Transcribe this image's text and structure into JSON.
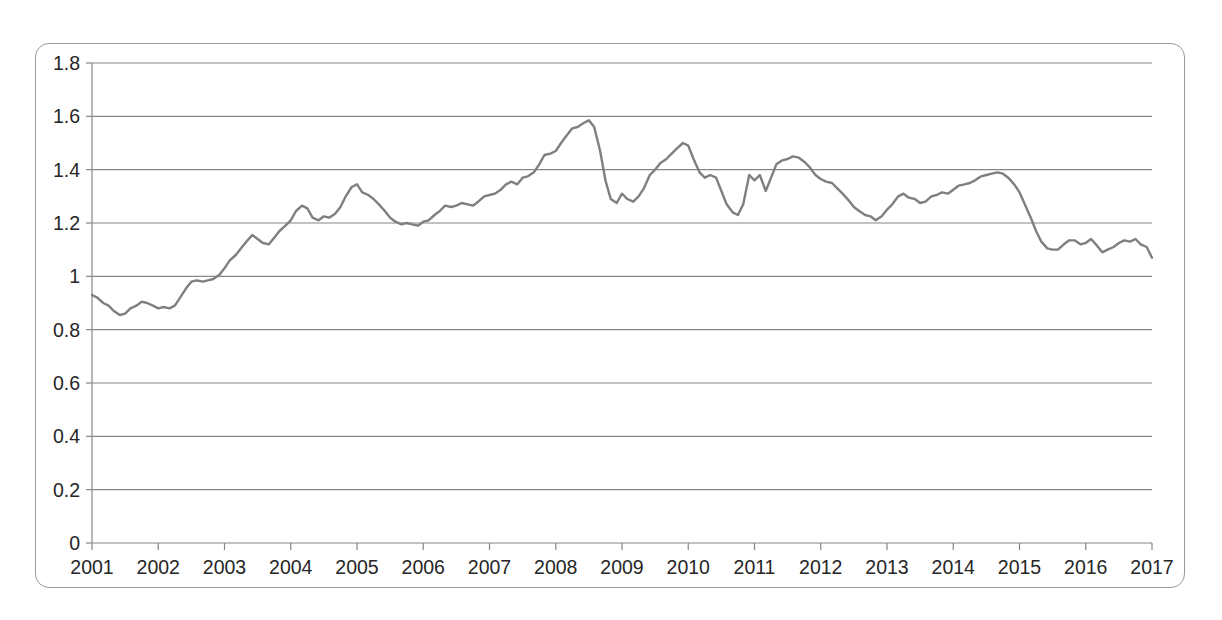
{
  "chart_data": {
    "type": "line",
    "title": "",
    "subtitle": "",
    "xlabel": "",
    "ylabel": "",
    "xlim": [
      2001,
      2017
    ],
    "ylim": [
      0,
      1.8
    ],
    "grid": true,
    "grid_axis": "y",
    "legend": false,
    "legend_position": "none",
    "line_color": "#7f7f7f",
    "background_color": "#ffffff",
    "axis_color": "#868686",
    "y_ticks": [
      "0",
      "0.2",
      "0.4",
      "0.6",
      "0.8",
      "1",
      "1.2",
      "1.4",
      "1.6",
      "1.8"
    ],
    "y_tick_values": [
      0,
      0.2,
      0.4,
      0.6,
      0.8,
      1.0,
      1.2,
      1.4,
      1.6,
      1.8
    ],
    "x_ticks": [
      "2001",
      "2002",
      "2003",
      "2004",
      "2005",
      "2006",
      "2007",
      "2008",
      "2009",
      "2010",
      "2011",
      "2012",
      "2013",
      "2014",
      "2015",
      "2016",
      "2017"
    ],
    "x_tick_values": [
      2001,
      2002,
      2003,
      2004,
      2005,
      2006,
      2007,
      2008,
      2009,
      2010,
      2011,
      2012,
      2013,
      2014,
      2015,
      2016,
      2017
    ],
    "series": [
      {
        "name": "rate",
        "x": [
          2001.0,
          2001.08,
          2001.17,
          2001.25,
          2001.33,
          2001.42,
          2001.5,
          2001.58,
          2001.67,
          2001.75,
          2001.83,
          2001.92,
          2002.0,
          2002.08,
          2002.17,
          2002.25,
          2002.33,
          2002.42,
          2002.5,
          2002.58,
          2002.67,
          2002.75,
          2002.83,
          2002.92,
          2003.0,
          2003.08,
          2003.17,
          2003.25,
          2003.33,
          2003.42,
          2003.5,
          2003.58,
          2003.67,
          2003.75,
          2003.83,
          2003.92,
          2004.0,
          2004.08,
          2004.17,
          2004.25,
          2004.33,
          2004.42,
          2004.5,
          2004.58,
          2004.67,
          2004.75,
          2004.83,
          2004.92,
          2005.0,
          2005.08,
          2005.17,
          2005.25,
          2005.33,
          2005.42,
          2005.5,
          2005.58,
          2005.67,
          2005.75,
          2005.83,
          2005.92,
          2006.0,
          2006.08,
          2006.17,
          2006.25,
          2006.33,
          2006.42,
          2006.5,
          2006.58,
          2006.67,
          2006.75,
          2006.83,
          2006.92,
          2007.0,
          2007.08,
          2007.17,
          2007.25,
          2007.33,
          2007.42,
          2007.5,
          2007.58,
          2007.67,
          2007.75,
          2007.83,
          2007.92,
          2008.0,
          2008.08,
          2008.17,
          2008.25,
          2008.33,
          2008.42,
          2008.5,
          2008.58,
          2008.67,
          2008.75,
          2008.83,
          2008.92,
          2009.0,
          2009.08,
          2009.17,
          2009.25,
          2009.33,
          2009.42,
          2009.5,
          2009.58,
          2009.67,
          2009.75,
          2009.83,
          2009.92,
          2010.0,
          2010.08,
          2010.17,
          2010.25,
          2010.33,
          2010.42,
          2010.5,
          2010.58,
          2010.67,
          2010.75,
          2010.83,
          2010.92,
          2011.0,
          2011.08,
          2011.17,
          2011.25,
          2011.33,
          2011.42,
          2011.5,
          2011.58,
          2011.67,
          2011.75,
          2011.83,
          2011.92,
          2012.0,
          2012.08,
          2012.17,
          2012.25,
          2012.33,
          2012.42,
          2012.5,
          2012.58,
          2012.67,
          2012.75,
          2012.83,
          2012.92,
          2013.0,
          2013.08,
          2013.17,
          2013.25,
          2013.33,
          2013.42,
          2013.5,
          2013.58,
          2013.67,
          2013.75,
          2013.83,
          2013.92,
          2014.0,
          2014.08,
          2014.17,
          2014.25,
          2014.33,
          2014.42,
          2014.5,
          2014.58,
          2014.67,
          2014.75,
          2014.83,
          2014.92,
          2015.0,
          2015.08,
          2015.17,
          2015.25,
          2015.33,
          2015.42,
          2015.5,
          2015.58,
          2015.67,
          2015.75,
          2015.83,
          2015.92,
          2016.0,
          2016.08,
          2016.17,
          2016.25,
          2016.33,
          2016.42,
          2016.5,
          2016.58,
          2016.67,
          2016.75,
          2016.83,
          2016.92,
          2017.0
        ],
        "values": [
          0.93,
          0.92,
          0.9,
          0.89,
          0.87,
          0.855,
          0.86,
          0.88,
          0.89,
          0.905,
          0.9,
          0.89,
          0.88,
          0.885,
          0.88,
          0.89,
          0.92,
          0.955,
          0.98,
          0.985,
          0.98,
          0.985,
          0.99,
          1.005,
          1.03,
          1.06,
          1.08,
          1.105,
          1.13,
          1.155,
          1.14,
          1.125,
          1.12,
          1.145,
          1.17,
          1.19,
          1.21,
          1.245,
          1.265,
          1.255,
          1.22,
          1.21,
          1.225,
          1.22,
          1.235,
          1.26,
          1.3,
          1.335,
          1.345,
          1.315,
          1.305,
          1.29,
          1.27,
          1.245,
          1.22,
          1.205,
          1.195,
          1.2,
          1.195,
          1.19,
          1.205,
          1.21,
          1.23,
          1.245,
          1.265,
          1.26,
          1.265,
          1.275,
          1.27,
          1.265,
          1.28,
          1.3,
          1.305,
          1.31,
          1.325,
          1.345,
          1.355,
          1.345,
          1.37,
          1.375,
          1.39,
          1.42,
          1.455,
          1.46,
          1.47,
          1.5,
          1.53,
          1.555,
          1.56,
          1.575,
          1.585,
          1.56,
          1.47,
          1.36,
          1.29,
          1.275,
          1.31,
          1.29,
          1.28,
          1.3,
          1.33,
          1.38,
          1.4,
          1.425,
          1.44,
          1.46,
          1.48,
          1.5,
          1.49,
          1.44,
          1.39,
          1.37,
          1.38,
          1.37,
          1.32,
          1.27,
          1.24,
          1.23,
          1.27,
          1.38,
          1.36,
          1.38,
          1.32,
          1.37,
          1.42,
          1.435,
          1.44,
          1.45,
          1.445,
          1.43,
          1.41,
          1.38,
          1.365,
          1.355,
          1.35,
          1.33,
          1.31,
          1.285,
          1.26,
          1.245,
          1.23,
          1.225,
          1.21,
          1.225,
          1.25,
          1.27,
          1.3,
          1.31,
          1.295,
          1.29,
          1.275,
          1.28,
          1.3,
          1.305,
          1.315,
          1.31,
          1.325,
          1.34,
          1.345,
          1.35,
          1.36,
          1.375,
          1.38,
          1.385,
          1.39,
          1.385,
          1.37,
          1.345,
          1.315,
          1.27,
          1.22,
          1.17,
          1.13,
          1.105,
          1.1,
          1.1,
          1.12,
          1.135,
          1.135,
          1.12,
          1.125,
          1.14,
          1.115,
          1.09,
          1.1,
          1.11,
          1.125,
          1.135,
          1.13,
          1.14,
          1.12,
          1.11,
          1.07
        ]
      }
    ]
  }
}
